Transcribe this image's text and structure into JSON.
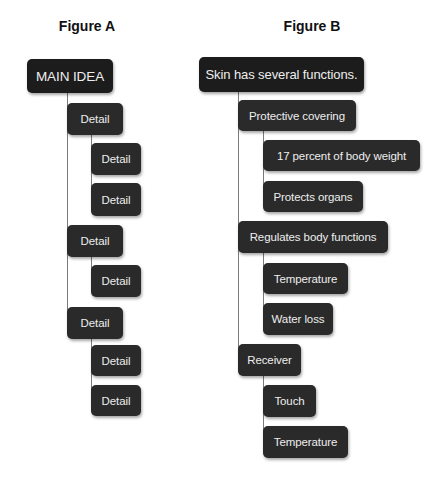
{
  "figure_a": {
    "title": "Figure A",
    "nodes": [
      {
        "label": "MAIN IDEA",
        "level": 0
      },
      {
        "label": "Detail",
        "level": 1
      },
      {
        "label": "Detail",
        "level": 2
      },
      {
        "label": "Detail",
        "level": 2
      },
      {
        "label": "Detail",
        "level": 1
      },
      {
        "label": "Detail",
        "level": 2
      },
      {
        "label": "Detail",
        "level": 1
      },
      {
        "label": "Detail",
        "level": 2
      },
      {
        "label": "Detail",
        "level": 2
      }
    ]
  },
  "figure_b": {
    "title": "Figure B",
    "nodes": [
      {
        "label": "Skin has several functions.",
        "level": 0
      },
      {
        "label": "Protective covering",
        "level": 1
      },
      {
        "label": "17 percent of body weight",
        "level": 2
      },
      {
        "label": "Protects organs",
        "level": 2
      },
      {
        "label": "Regulates body functions",
        "level": 1
      },
      {
        "label": "Temperature",
        "level": 2
      },
      {
        "label": "Water loss",
        "level": 2
      },
      {
        "label": "Receiver",
        "level": 1
      },
      {
        "label": "Touch",
        "level": 2
      },
      {
        "label": "Temperature",
        "level": 2
      }
    ]
  },
  "colors": {
    "root_box": "#1c1c1c",
    "detail_box": "#2a2a2a",
    "box_text": "#eeeeee",
    "connector": "#7a7a7a",
    "background": "#ffffff"
  }
}
